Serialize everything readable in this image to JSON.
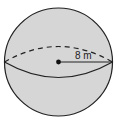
{
  "figure": {
    "shape": "sphere",
    "radius_label": "8 m",
    "colors": {
      "fill": "#d6d6d6",
      "stroke": "#222222",
      "background": "#ffffff"
    }
  }
}
